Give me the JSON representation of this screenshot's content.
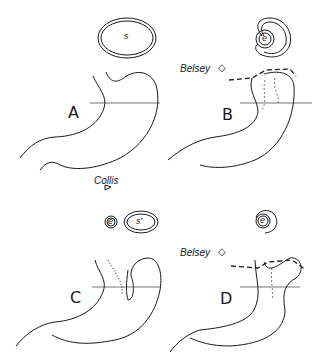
{
  "panels": [
    {
      "letter": "A",
      "section_labels": [
        "s"
      ]
    },
    {
      "letter": "B",
      "procedure": "Belsey",
      "section_labels": [
        "e"
      ]
    },
    {
      "letter": "C",
      "procedure": "Collis",
      "section_labels": [
        "e",
        "s'"
      ]
    },
    {
      "letter": "D",
      "procedure": "Belsey",
      "section_labels": [
        "e"
      ]
    }
  ],
  "colors": {
    "line": "#1a1a1a",
    "background": "#ffffff"
  }
}
